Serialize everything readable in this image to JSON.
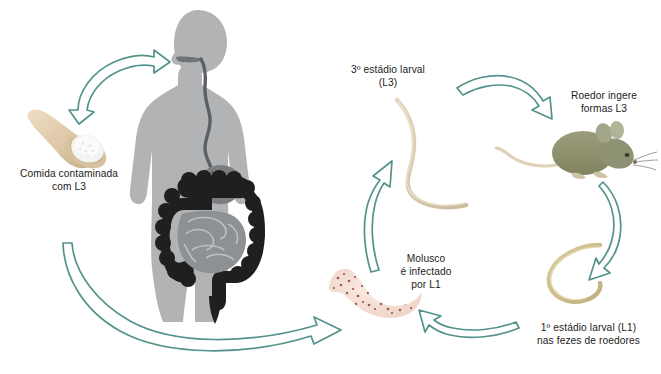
{
  "figure": {
    "type": "life-cycle-diagram",
    "background_color": "#ffffff",
    "arrow_color": "#4e948c",
    "arrow_fill": "#ffffff",
    "text_color": "#1b1b1b"
  },
  "labels": {
    "food": "Comida contaminada\ncom L3",
    "larval_l3": "3º estádio larval\n(L3)",
    "rodent": "Roedor ingere\nformas L3",
    "larval_l1": "1º estádio larval (L1)\nnas fezes de roedores",
    "mollusc": "Molusco\né infectado\npor L1"
  },
  "illustrations": {
    "human": {
      "name": "human-silhouette",
      "body_color": "#b0b2b4",
      "organ_color": "#2b2b2b",
      "stomach_color": "#777a7c"
    },
    "spoon": {
      "name": "wooden-spoon-with-powder",
      "handle_color": "#e5cdb0",
      "bowl_color": "#cbb896",
      "powder_color": "#f2f3f1"
    },
    "rodent": {
      "name": "rodent-mouse",
      "body_color": "#8e9172",
      "tail_color": "#ddd2bb"
    },
    "worm_l3": {
      "name": "larval-worm-l3",
      "color": "#d9c9b2"
    },
    "worm_l1": {
      "name": "larval-worm-l1",
      "color": "#c8bc8f"
    },
    "mollusc": {
      "name": "mollusc-slug",
      "body_color": "#f3ded4",
      "speckle_color": "#8b3a2a"
    }
  },
  "arrows": [
    {
      "name": "arrow-food-to-human",
      "from": "food",
      "to": "human"
    },
    {
      "name": "arrow-human-to-mollusc",
      "from": "human",
      "to": "mollusc"
    },
    {
      "name": "arrow-mollusc-to-l3",
      "from": "mollusc",
      "to": "larval_l3"
    },
    {
      "name": "arrow-l3-to-rodent",
      "from": "larval_l3",
      "to": "rodent"
    },
    {
      "name": "arrow-rodent-to-l1",
      "from": "rodent",
      "to": "larval_l1"
    },
    {
      "name": "arrow-l1-to-mollusc",
      "from": "larval_l1",
      "to": "mollusc"
    }
  ]
}
